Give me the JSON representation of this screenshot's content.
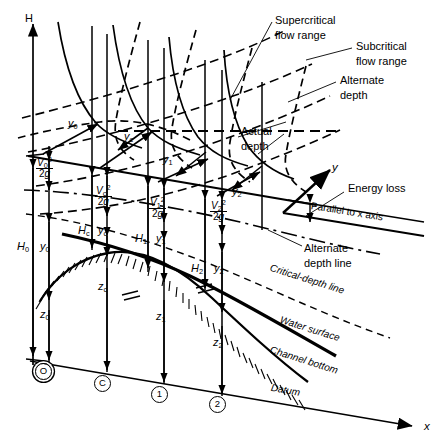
{
  "figure": {
    "type": "engineering-diagram",
    "axes": {
      "vertical_label": "H",
      "horizontal_label": "x",
      "depth_axis_label": "y"
    },
    "annotations": {
      "supercritical": "Supercritical\nflow range",
      "supercritical_l1": "Supercritical",
      "supercritical_l2": "flow range",
      "subcritical_l1": "Subcritical",
      "subcritical_l2": "flow range",
      "alternate_depth_l1": "Alternate",
      "alternate_depth_l2": "depth",
      "actual_depth_l1": "Actual",
      "actual_depth_l2": "depth",
      "energy_loss": "Energy loss",
      "parallel_axis": "Parallel to x axis",
      "alternate_depth_line_l1": "Alternate",
      "alternate_depth_line_l2": "depth line",
      "critical_depth_line": "Critical-depth line",
      "water_surface": "Water surface",
      "channel_bottom": "Channel bottom",
      "datum": "Datum"
    },
    "stations": [
      {
        "id": "station-0",
        "mark": "O",
        "double_circle": true,
        "x": 42,
        "y": 370
      },
      {
        "id": "station-c",
        "mark": "C",
        "double_circle": false,
        "x": 101,
        "y": 381
      },
      {
        "id": "station-1",
        "mark": "1",
        "double_circle": false,
        "x": 158,
        "y": 392
      },
      {
        "id": "station-2",
        "mark": "2",
        "double_circle": false,
        "x": 216,
        "y": 402
      }
    ],
    "depth_labels": [
      {
        "name": "y-sub-0",
        "base": "y",
        "sub": "0",
        "x": 68,
        "y": 117
      },
      {
        "name": "y-sub-c",
        "base": "y",
        "sub": "c",
        "x": 124,
        "y": 132
      },
      {
        "name": "y-sub-1",
        "base": "y",
        "sub": "1",
        "x": 160,
        "y": 155
      },
      {
        "name": "y-sub-2",
        "base": "y",
        "sub": "2",
        "x": 230,
        "y": 187
      }
    ],
    "head_labels": [
      {
        "name": "H-sub-0",
        "base": "H",
        "sub": "0",
        "x": 19,
        "y": 240
      },
      {
        "name": "H-sub-c",
        "base": "H",
        "sub": "c",
        "x": 81,
        "y": 226
      },
      {
        "name": "H-sub-1",
        "base": "H",
        "sub": "1",
        "x": 140,
        "y": 236
      },
      {
        "name": "H-sub-2",
        "base": "H",
        "sub": "2",
        "x": 200,
        "y": 265
      }
    ],
    "depth_dim_labels": [
      {
        "name": "y-dim-0",
        "base": "y",
        "sub": "0",
        "x": 41,
        "y": 240
      },
      {
        "name": "y-dim-c",
        "base": "y",
        "sub": "c",
        "x": 99,
        "y": 226
      },
      {
        "name": "y-dim-1",
        "base": "y",
        "sub": "1",
        "x": 158,
        "y": 236
      },
      {
        "name": "y-dim-2",
        "base": "y",
        "sub": "2",
        "x": 219,
        "y": 266
      }
    ],
    "elevation_labels": [
      {
        "name": "z-sub-0",
        "base": "z",
        "sub": "0",
        "x": 41,
        "y": 310
      },
      {
        "name": "z-sub-c",
        "base": "z",
        "sub": "c",
        "x": 101,
        "y": 283
      },
      {
        "name": "z-sub-1",
        "base": "z",
        "sub": "1",
        "x": 159,
        "y": 312
      },
      {
        "name": "z-sub-2",
        "base": "z",
        "sub": "2",
        "x": 216,
        "y": 337
      }
    ],
    "velocity_heads": [
      {
        "name": "velocity-head-0",
        "numerator": "V",
        "num_sub": "0",
        "num_sup": "2",
        "denominator": "2g",
        "x": 40,
        "y": 163
      },
      {
        "name": "velocity-head-c",
        "numerator": "V",
        "num_sub": "c",
        "num_sup": "2",
        "denominator": "2g",
        "x": 99,
        "y": 190
      },
      {
        "name": "velocity-head-1",
        "numerator": "V",
        "num_sub": "1",
        "num_sup": "2",
        "denominator": "2g",
        "x": 152,
        "y": 202
      },
      {
        "name": "velocity-head-2",
        "numerator": "V",
        "num_sub": "2",
        "num_sup": "2",
        "denominator": "2g",
        "x": 213,
        "y": 205
      }
    ],
    "colors": {
      "ink": "#000000",
      "background": "#ffffff"
    }
  }
}
